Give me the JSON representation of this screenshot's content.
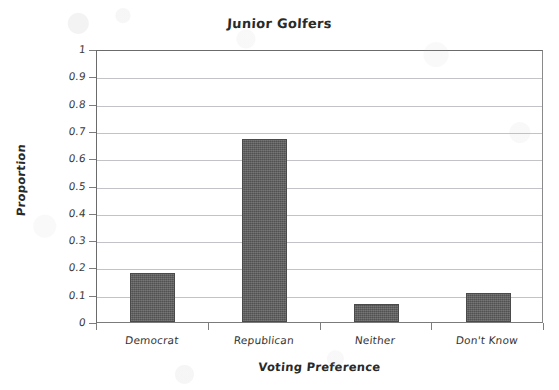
{
  "chart_data": {
    "type": "bar",
    "title": "Junior Golfers",
    "xlabel": "Voting Preference",
    "ylabel": "Proportion",
    "categories": [
      "Democrat",
      "Republican",
      "Neither",
      "Don't Know"
    ],
    "values": [
      0.18,
      0.67,
      0.065,
      0.105
    ],
    "ylim": [
      0,
      1
    ],
    "ytick_labels": [
      "0",
      "0.1",
      "0.2",
      "0.3",
      "0.4",
      "0.5",
      "0.6",
      "0.7",
      "0.8",
      "0.9",
      "1"
    ],
    "ytick_values": [
      0,
      0.1,
      0.2,
      0.3,
      0.4,
      0.5,
      0.6,
      0.7,
      0.8,
      0.9,
      1
    ],
    "grid": true,
    "legend": false,
    "bar_color": "#5b5b5b",
    "gridline_color": "#b9b9bd",
    "axis_color": "#6b6b6b"
  }
}
